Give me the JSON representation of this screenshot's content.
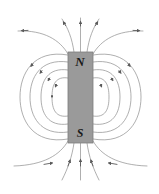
{
  "figure": {
    "type": "magnetic-field-diagram",
    "background_color": "#ffffff",
    "width": 159,
    "height": 194
  },
  "magnet": {
    "label_north": "N",
    "label_south": "S",
    "fill_color": "#9a9a9a",
    "stroke_color": "#7d7d7d",
    "x": 68,
    "y": 52,
    "width": 25,
    "height": 91
  },
  "field_lines": {
    "stroke_color": "#8c8c8c",
    "arrow_color": "#5a5a5a",
    "stroke_width": 0.7,
    "closed_loop_count_per_side": 4,
    "open_line_count_top": 5,
    "open_line_count_bottom": 5,
    "direction_note": "out of north pole, into south pole"
  }
}
